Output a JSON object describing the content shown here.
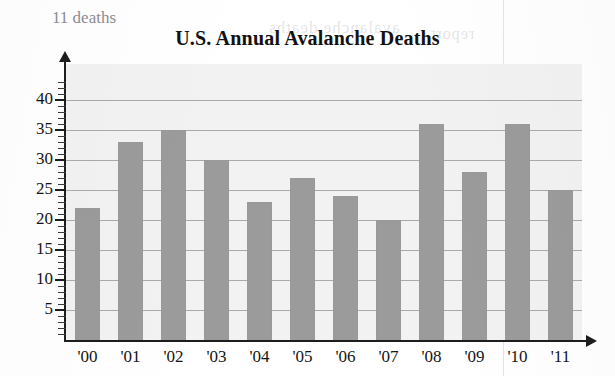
{
  "page": {
    "note_label": "11 deaths"
  },
  "chart_data": {
    "type": "bar",
    "title": "U.S. Annual Avalanche Deaths",
    "xlabel": "",
    "ylabel": "",
    "categories": [
      "'00",
      "'01",
      "'02",
      "'03",
      "'04",
      "'05",
      "'06",
      "'07",
      "'08",
      "'09",
      "'10",
      "'11"
    ],
    "values": [
      22,
      33,
      35,
      30,
      23,
      27,
      24,
      20,
      36,
      28,
      36,
      25
    ],
    "ylim": [
      0,
      43
    ],
    "ytick_labels": [
      "5",
      "10",
      "15",
      "20",
      "25",
      "30",
      "35",
      "40"
    ],
    "ytick_values": [
      5,
      10,
      15,
      20,
      25,
      30,
      35,
      40
    ],
    "minor_tick_step": 1,
    "grid": true,
    "grid_axis": "y",
    "legend": null,
    "bar_color": "#9b9b9b",
    "plot_background": "#f2f2f2",
    "axis_color": "#1d1d1d",
    "gridline_color": "#6e6e76"
  },
  "artifacts": {
    "bleed_text_1": "decreased by 11 deaths",
    "bleed_text_2": "total number of",
    "bleed_text_3": "avalanche deaths",
    "bleed_text_4": "report"
  }
}
